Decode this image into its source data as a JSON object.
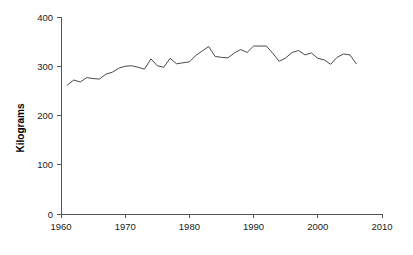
{
  "chart_data": {
    "type": "line",
    "title": "",
    "subtitle": "",
    "xlabel": "",
    "ylabel": "Kilograms",
    "xlim": [
      1960,
      2010
    ],
    "ylim": [
      0,
      400
    ],
    "xticks": [
      1960,
      1970,
      1980,
      1990,
      2000,
      2010
    ],
    "yticks": [
      0,
      100,
      200,
      300,
      400
    ],
    "grid": false,
    "legend": null,
    "legend_position": "none",
    "line_color": "#4a4a4a",
    "series": [
      {
        "name": "Kilograms",
        "x": [
          1961,
          1962,
          1963,
          1964,
          1965,
          1966,
          1967,
          1968,
          1969,
          1970,
          1971,
          1972,
          1973,
          1974,
          1975,
          1976,
          1977,
          1978,
          1979,
          1980,
          1981,
          1982,
          1983,
          1984,
          1985,
          1986,
          1987,
          1988,
          1989,
          1990,
          1991,
          1992,
          1993,
          1994,
          1995,
          1996,
          1997,
          1998,
          1999,
          2000,
          2001,
          2002,
          2003,
          2004,
          2005,
          2006
        ],
        "values": [
          262,
          272,
          268,
          277,
          275,
          274,
          284,
          288,
          296,
          300,
          301,
          298,
          294,
          315,
          301,
          298,
          316,
          305,
          307,
          309,
          322,
          331,
          340,
          320,
          318,
          317,
          327,
          334,
          328,
          341,
          341,
          341,
          326,
          310,
          317,
          328,
          332,
          323,
          327,
          316,
          313,
          304,
          318,
          325,
          323,
          305
        ]
      }
    ]
  },
  "axis": {
    "y_title": "Kilograms"
  }
}
